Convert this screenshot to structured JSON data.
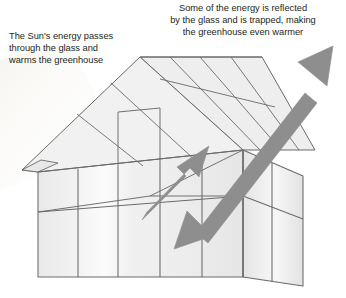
{
  "diagram": {
    "subject": "greenhouse",
    "captions": {
      "left": {
        "name": "sun-energy-caption",
        "lines": [
          "The Sun's energy passes",
          "through the glass and",
          "warms the greenhouse"
        ],
        "full_text": "The Sun's energy passes through the glass and warms the greenhouse"
      },
      "right": {
        "name": "reflected-energy-caption",
        "lines": [
          "Some of the energy is reflected",
          "by the glass and is trapped, making",
          "the greenhouse even warmer"
        ],
        "full_text": "Some of the energy is reflected by the glass and is trapped, making the greenhouse even warmer"
      }
    },
    "arrows": [
      {
        "name": "incoming-energy-arrow",
        "label": "Sun's energy entering the greenhouse",
        "direction": "up-right",
        "heads": 1,
        "tail": [
          142,
          213
        ],
        "tip": [
          208,
          147
        ]
      },
      {
        "name": "trapped-energy-arrow",
        "label": "Energy reflected by the glass and trapped",
        "direction": "double-headed diagonal",
        "heads": 2,
        "tail": [
          174,
          248
        ],
        "tip": [
          332,
          47
        ]
      }
    ],
    "colors": {
      "arrow_fill": "#8e8e8e",
      "arrow_stroke": "#8e8e8e",
      "glass_fill": "#eeeeee",
      "glass_fill_light": "#f6f6f6",
      "frame_stroke": "#6a6a6a",
      "text": "#231f20",
      "background": "#ffffff"
    },
    "structure": {
      "roof": "gable roof with glazing bars, overhanging eaves",
      "walls": "glazed front and right side faces with vertical mullions and a horizontal mid-rail",
      "visible_faces": [
        "front",
        "right-side",
        "roof-front-slope",
        "roof-right-slope",
        "gable-end"
      ]
    }
  }
}
